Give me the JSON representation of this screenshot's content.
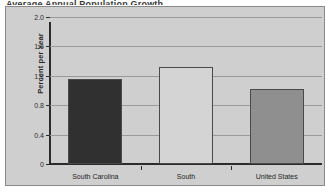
{
  "title_sliver": "Average Annual Population Growth",
  "chart_data": {
    "type": "bar",
    "title": "",
    "xlabel": "",
    "ylabel": "Percent per Year",
    "categories": [
      "South Carolina",
      "South",
      "United States"
    ],
    "values": [
      1.15,
      1.32,
      1.02
    ],
    "series": [
      {
        "name": "Percent per Year",
        "values": [
          1.15,
          1.32,
          1.02
        ]
      }
    ],
    "bar_colors": [
      "#303030",
      "#d4d4d4",
      "#8f8f8f"
    ],
    "bar_border_color": "#4a4a4a",
    "ylim": [
      0,
      2.0
    ],
    "yticks": [
      0,
      0.4,
      0.8,
      1.2,
      1.6,
      2.0
    ],
    "ytick_labels": [
      "0",
      "0.4",
      "0.8",
      "1.2",
      "1.6",
      "2.0"
    ],
    "grid": true,
    "grid_color": "#9a9a9a",
    "legend": false,
    "legend_position": "none",
    "plot_background": "#cfcfcf",
    "page_background": "#ffffff"
  }
}
